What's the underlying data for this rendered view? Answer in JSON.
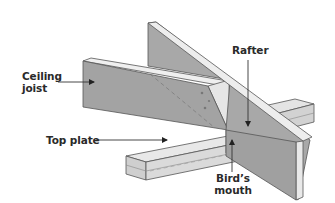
{
  "diagram": {
    "labels": {
      "ceiling_joist": [
        "Ceiling",
        "joist"
      ],
      "rafter": "Rafter",
      "top_plate": "Top plate",
      "birds_mouth": [
        "Bird’s",
        "mouth"
      ]
    },
    "colors": {
      "background": "#ffffff",
      "face_dark": "#9a9a9a",
      "face_mid": "#b5b5b5",
      "face_light": "#dcdcdc",
      "edge_light": "#ececec",
      "outline": "#555555",
      "text": "#2a2a2a",
      "leader": "#333333"
    },
    "components": [
      "ceiling-joist",
      "rafter",
      "top-plate",
      "birds-mouth-notch"
    ]
  }
}
